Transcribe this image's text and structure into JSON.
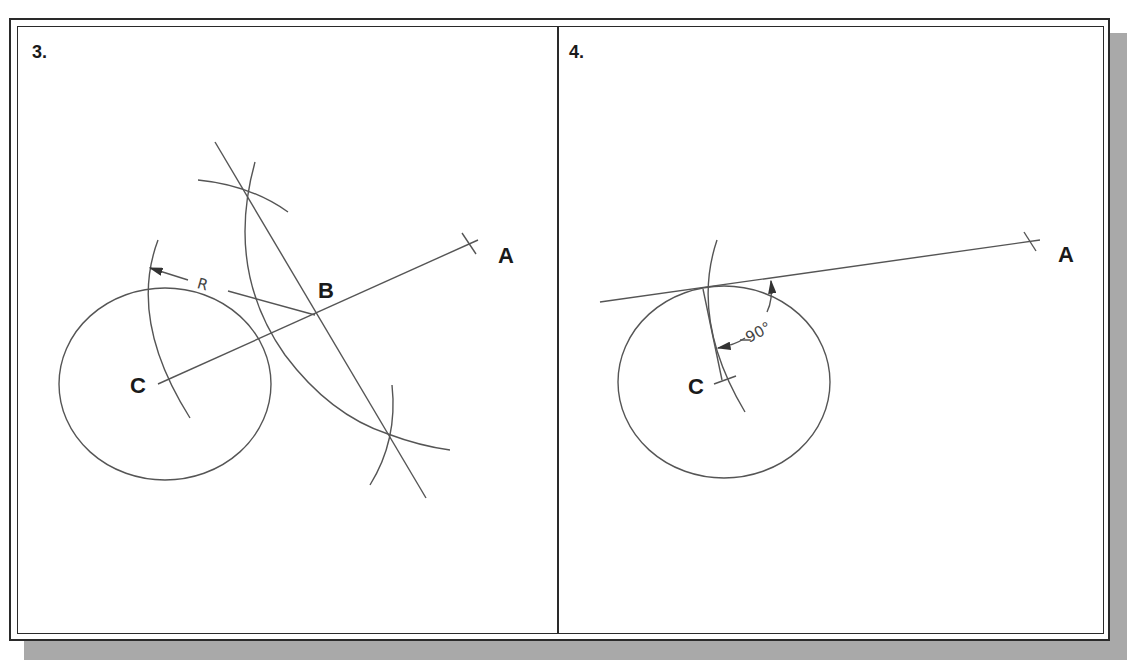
{
  "figure": {
    "panels": [
      {
        "step_label": "3.",
        "points": {
          "A": "A",
          "B": "B",
          "C": "C"
        },
        "dimension_label": "R"
      },
      {
        "step_label": "4.",
        "points": {
          "A": "A",
          "C": "C"
        },
        "dimension_label": "90°"
      }
    ]
  }
}
